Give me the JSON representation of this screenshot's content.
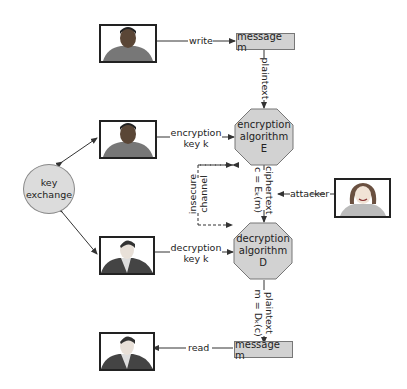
{
  "nodes": {
    "message_top": "message m",
    "message_bottom": "message m",
    "encryption": [
      "encryption",
      "algorithm",
      "E"
    ],
    "decryption": [
      "decryption",
      "algorithm",
      "D"
    ],
    "key_exchange": [
      "key",
      "exchange"
    ]
  },
  "edges": {
    "write": "write",
    "read": "read",
    "plaintext_top": "plaintext",
    "plaintext_bottom": [
      "plaintext",
      "m = Dₖ(c)"
    ],
    "ciphertext": [
      "ciphertext",
      "c = Eₖ(m)"
    ],
    "encryption_key": [
      "encryption",
      "key k"
    ],
    "decryption_key": [
      "decryption",
      "key k"
    ],
    "insecure_channel": [
      "insecure",
      "channel"
    ],
    "attacker": "attacker"
  },
  "people": {
    "writer": "person-writer",
    "encryptor": "person-encryptor",
    "decryptor": "person-decryptor",
    "reader": "person-reader",
    "attacker": "person-attacker"
  },
  "colors": {
    "fill": "#d2d2d2",
    "stroke": "#777777",
    "line": "#333333"
  }
}
